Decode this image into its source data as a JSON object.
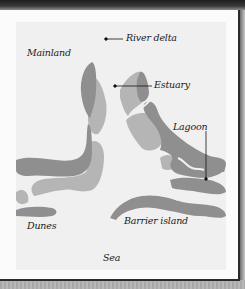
{
  "map": {
    "labels": {
      "mainland": "Mainland",
      "river_delta": "River delta",
      "estuary": "Estuary",
      "lagoon": "Lagoon",
      "dunes": "Dunes",
      "barrier_island": "Barrier island",
      "sea": "Sea"
    },
    "colors": {
      "background": "#f0f0f0",
      "dark_land": "#8f8f8f",
      "medium_land": "#b5b5b5",
      "leader_line": "#111111",
      "frame": "#2a2a2a"
    }
  }
}
